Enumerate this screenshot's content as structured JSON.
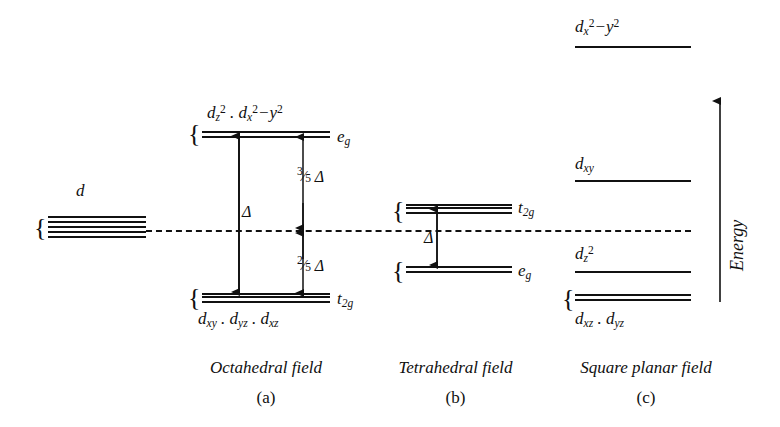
{
  "figure": {
    "ink_color": "#111111",
    "background": "#ffffff"
  },
  "free_ion": {
    "label": "d",
    "degeneracy": 5
  },
  "energy_axis": {
    "label": "Energy",
    "direction": "up"
  },
  "panels": [
    {
      "id": "octahedral",
      "caption": "Octahedral field",
      "key": "(a)",
      "levels": [
        {
          "id": "eg",
          "term": "e",
          "term_sub": "g",
          "orbitals_prefix": "d",
          "orbitals": "d z2 . d x2-y2",
          "line_count": 2
        },
        {
          "id": "t2g",
          "term": "t",
          "term_sub": "2g",
          "orbitals": "d xy . d yz . d xz",
          "line_count": 3
        }
      ],
      "annotations": {
        "total_split": "Δ",
        "upper_shift": "3/5 Δ",
        "upper_num": "3",
        "upper_den": "5",
        "lower_shift": "2/5 Δ",
        "lower_num": "2",
        "lower_den": "5",
        "delta_symbol": "Δ"
      }
    },
    {
      "id": "tetrahedral",
      "caption": "Tetrahedral field",
      "key": "(b)",
      "levels": [
        {
          "id": "t2g",
          "term": "t",
          "term_sub": "2g",
          "line_count": 3
        },
        {
          "id": "eg",
          "term": "e",
          "term_sub": "g",
          "line_count": 2
        }
      ],
      "annotations": {
        "total_split": "Δ",
        "delta_symbol": "Δ"
      }
    },
    {
      "id": "square_planar",
      "caption": "Square planar field",
      "key": "(c)",
      "levels": [
        {
          "id": "dx2y2",
          "orbital_base": "d",
          "orbital_sub": "x",
          "label": "d x2-y2",
          "line_count": 1
        },
        {
          "id": "dxy",
          "label": "d xy",
          "line_count": 1
        },
        {
          "id": "dz2",
          "label": "d z2",
          "line_count": 1
        },
        {
          "id": "dxz_dyz",
          "label": "d xz . d yz",
          "line_count": 2
        }
      ]
    }
  ],
  "symbols": {
    "brace": "{",
    "delta": "Δ",
    "dot": "."
  }
}
